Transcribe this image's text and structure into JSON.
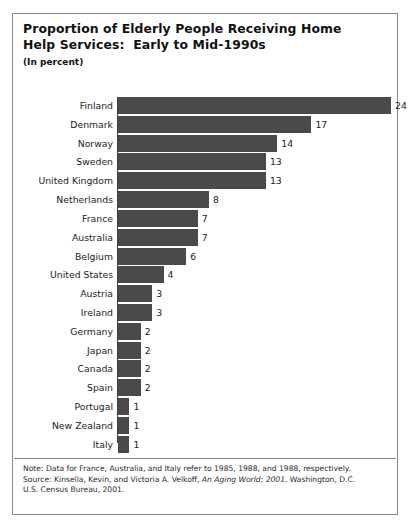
{
  "figure": {
    "title_line1": "Proportion of Elderly People Receiving Home",
    "title_line2": "Help Services:  Early to Mid-1990s",
    "subtitle": "(In percent)",
    "bar_color": "#4a4a4a",
    "border_color": "#8a8a8a",
    "text_color": "#1c1c1c"
  },
  "notes": {
    "line1": "Note:  Data for France, Australia, and Italy refer to 1985, 1988, and 1988, respectively.",
    "line2_prefix": "Source: Kinsella, Kevin, and Victoria A. Velkoff, ",
    "line2_italic": "An Aging World: 2001",
    "line2_suffix": ". Washington, D.C.",
    "line3": "U.S. Census Bureau, 2001."
  },
  "chart_data": {
    "type": "bar",
    "orientation": "horizontal",
    "title": "Proportion of Elderly People Receiving Home Help Services: Early to Mid-1990s",
    "subtitle": "(In percent)",
    "xlabel": "",
    "ylabel": "",
    "xlim": [
      0,
      24
    ],
    "grid": false,
    "legend": null,
    "value_labels": true,
    "categories": [
      "Finland",
      "Denmark",
      "Norway",
      "Sweden",
      "United Kingdom",
      "Netherlands",
      "France",
      "Australia",
      "Belgium",
      "United States",
      "Austria",
      "Ireland",
      "Germany",
      "Japan",
      "Canada",
      "Spain",
      "Portugal",
      "New Zealand",
      "Italy"
    ],
    "values": [
      24,
      17,
      14,
      13,
      13,
      8,
      7,
      7,
      6,
      4,
      3,
      3,
      2,
      2,
      2,
      2,
      1,
      1,
      1
    ],
    "value_label_text": [
      "24",
      "17",
      "14",
      "13",
      "13",
      "8",
      "7",
      "7",
      "6",
      "4",
      "3",
      "3",
      "2",
      "2",
      "2",
      "2",
      "1",
      "1",
      "1"
    ]
  }
}
